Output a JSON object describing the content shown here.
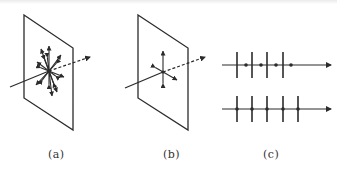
{
  "diagram": {
    "panels": [
      {
        "id": "a",
        "caption": "(a)",
        "description": "unpolarized light: plane with eight double-headed E-vectors radiating from the point where the ray crosses",
        "plane": [
          [
            24,
            15
          ],
          [
            73,
            48
          ],
          [
            73,
            130
          ],
          [
            24,
            98
          ]
        ],
        "center": [
          49,
          71
        ],
        "ray_in": [
          [
            10,
            87
          ],
          [
            49,
            71
          ]
        ],
        "ray_out_dashed": [
          [
            49,
            71
          ],
          [
            90,
            57
          ]
        ],
        "vectors": [
          {
            "dx": 0,
            "dy": -25
          },
          {
            "dx": -8,
            "dy": -22
          },
          {
            "dx": 12,
            "dy": -16
          },
          {
            "dx": 15,
            "dy": 6
          },
          {
            "dx": 3,
            "dy": 25
          },
          {
            "dx": -13,
            "dy": 14
          },
          {
            "dx": -12,
            "dy": -9
          },
          {
            "dx": 8,
            "dy": 21
          }
        ]
      },
      {
        "id": "b",
        "caption": "(b)",
        "description": "two orthogonal polarization components: one vertical double arrow and one in-plane double arrow",
        "plane": [
          [
            138,
            15
          ],
          [
            188,
            48
          ],
          [
            188,
            130
          ],
          [
            138,
            98
          ]
        ],
        "center": [
          163,
          72
        ],
        "ray_in": [
          [
            125,
            88
          ],
          [
            163,
            72
          ]
        ],
        "ray_out_dashed": [
          [
            163,
            72
          ],
          [
            205,
            57
          ]
        ],
        "vectors": [
          {
            "dx": 0,
            "dy": -21
          },
          {
            "dx": 14,
            "dy": 8
          }
        ]
      },
      {
        "id": "c",
        "caption": "(c)",
        "description": "schematic notation: top line with perpendicular strokes and dots (mixed), bottom line with perpendicular strokes only",
        "lines": [
          {
            "y": 65,
            "x_start": 222,
            "x_end": 331,
            "ticks_x": [
              237,
              252,
              267,
              283
            ],
            "dots_x": [
              246,
              261,
              276,
              291
            ]
          },
          {
            "y": 109,
            "x_start": 222,
            "x_end": 331,
            "ticks_x": [
              237,
              252,
              267,
              283,
              298
            ],
            "dots_x": [
              237,
              252,
              267,
              283,
              298
            ]
          }
        ],
        "tick_half_length": 13
      }
    ],
    "captions": [
      "(a)",
      "(b)",
      "(c)"
    ],
    "stroke_color": "#2b2b2b"
  }
}
